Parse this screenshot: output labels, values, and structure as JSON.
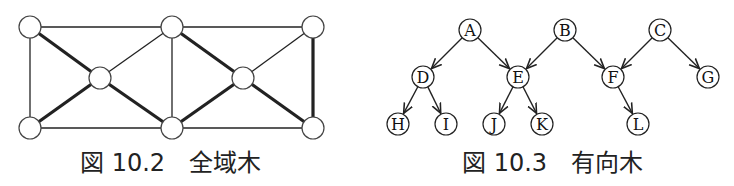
{
  "figures": [
    {
      "id": "fig-10-2",
      "caption": "図 10.2　全域木",
      "type": "spanning-tree",
      "nodes": [
        {
          "id": "n1",
          "x": 30,
          "y": 27
        },
        {
          "id": "n2",
          "x": 172,
          "y": 27
        },
        {
          "id": "n3",
          "x": 313,
          "y": 27
        },
        {
          "id": "n4",
          "x": 100,
          "y": 78
        },
        {
          "id": "n5",
          "x": 243,
          "y": 78
        },
        {
          "id": "n6",
          "x": 30,
          "y": 128
        },
        {
          "id": "n7",
          "x": 172,
          "y": 128
        },
        {
          "id": "n8",
          "x": 313,
          "y": 128
        }
      ],
      "edges": [
        {
          "from": "n1",
          "to": "n2",
          "tree": false
        },
        {
          "from": "n2",
          "to": "n3",
          "tree": false
        },
        {
          "from": "n6",
          "to": "n7",
          "tree": false
        },
        {
          "from": "n7",
          "to": "n8",
          "tree": false
        },
        {
          "from": "n1",
          "to": "n6",
          "tree": false
        },
        {
          "from": "n2",
          "to": "n7",
          "tree": false
        },
        {
          "from": "n2",
          "to": "n4",
          "tree": false
        },
        {
          "from": "n3",
          "to": "n5",
          "tree": false
        },
        {
          "from": "n1",
          "to": "n4",
          "tree": true
        },
        {
          "from": "n4",
          "to": "n6",
          "tree": true
        },
        {
          "from": "n4",
          "to": "n7",
          "tree": true
        },
        {
          "from": "n2",
          "to": "n5",
          "tree": true
        },
        {
          "from": "n5",
          "to": "n7",
          "tree": true
        },
        {
          "from": "n5",
          "to": "n8",
          "tree": true
        },
        {
          "from": "n3",
          "to": "n8",
          "tree": true
        }
      ]
    },
    {
      "id": "fig-10-3",
      "caption": "図 10.3　有向木",
      "type": "directed-forest",
      "nodes": [
        {
          "id": "A",
          "label": "A",
          "x": 470,
          "y": 30
        },
        {
          "id": "B",
          "label": "B",
          "x": 565,
          "y": 30
        },
        {
          "id": "C",
          "label": "C",
          "x": 660,
          "y": 30
        },
        {
          "id": "D",
          "label": "D",
          "x": 423,
          "y": 77
        },
        {
          "id": "E",
          "label": "E",
          "x": 518,
          "y": 77
        },
        {
          "id": "F",
          "label": "F",
          "x": 613,
          "y": 77
        },
        {
          "id": "G",
          "label": "G",
          "x": 708,
          "y": 77
        },
        {
          "id": "H",
          "label": "H",
          "x": 398,
          "y": 124
        },
        {
          "id": "I",
          "label": "I",
          "x": 446,
          "y": 124
        },
        {
          "id": "J",
          "label": "J",
          "x": 494,
          "y": 124
        },
        {
          "id": "K",
          "label": "K",
          "x": 542,
          "y": 124
        },
        {
          "id": "L",
          "label": "L",
          "x": 638,
          "y": 124
        }
      ],
      "edges": [
        {
          "from": "A",
          "to": "D"
        },
        {
          "from": "A",
          "to": "E"
        },
        {
          "from": "B",
          "to": "E"
        },
        {
          "from": "B",
          "to": "F"
        },
        {
          "from": "C",
          "to": "F"
        },
        {
          "from": "C",
          "to": "G"
        },
        {
          "from": "D",
          "to": "H"
        },
        {
          "from": "D",
          "to": "I"
        },
        {
          "from": "E",
          "to": "J"
        },
        {
          "from": "E",
          "to": "K"
        },
        {
          "from": "F",
          "to": "L"
        }
      ]
    }
  ]
}
